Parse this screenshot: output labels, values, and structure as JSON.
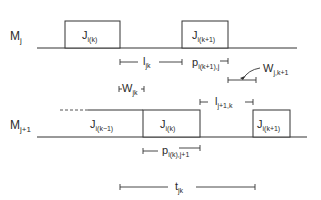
{
  "diagram": {
    "type": "two-machine schedule timing diagram",
    "rows": [
      {
        "machine": "M",
        "machine_sub": "j",
        "jobs": [
          {
            "name": "J",
            "sub": "i(k)"
          },
          {
            "name": "J",
            "sub": "i(k+1)"
          }
        ]
      },
      {
        "machine": "M",
        "machine_sub": "j+1",
        "jobs": [
          {
            "name": "J",
            "sub": "i(k−1)"
          },
          {
            "name": "J",
            "sub": "i(k)"
          },
          {
            "name": "J",
            "sub": "i(k+1)"
          }
        ]
      }
    ],
    "intervals": {
      "l_jk": {
        "name": "l",
        "sub": "jk"
      },
      "p_next_j": {
        "name": "p",
        "sub": "i(k+1),j"
      },
      "w_j_k1": {
        "name": "W",
        "sub": "j,k+1"
      },
      "w_jk": {
        "name": "W",
        "sub": "jk"
      },
      "l_j1_k": {
        "name": "l",
        "sub": "j+1,k"
      },
      "p_k_j1": {
        "name": "p",
        "sub": "i(k),j+1"
      },
      "t_jk": {
        "name": "t",
        "sub": "jk"
      }
    }
  }
}
